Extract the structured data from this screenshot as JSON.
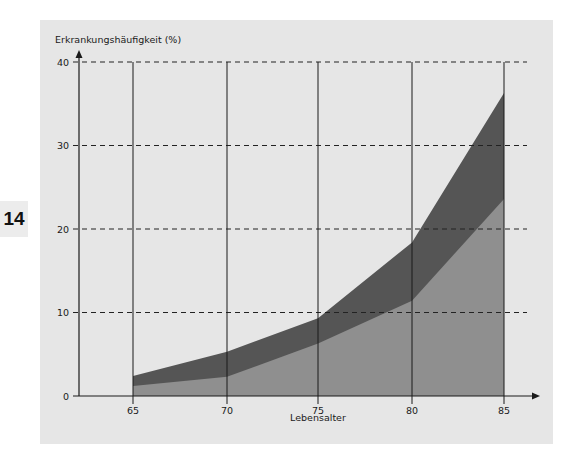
{
  "chapter_badge": "14",
  "chart_data": {
    "type": "area",
    "title": "",
    "ylabel": "Erkrankungshäufigkeit (%)",
    "xlabel": "Lebensalter",
    "x": [
      65,
      70,
      75,
      80,
      85
    ],
    "xticks": [
      "65",
      "70",
      "75",
      "80",
      "85"
    ],
    "yticks": [
      "0",
      "10",
      "20",
      "30",
      "40"
    ],
    "ylim": [
      0,
      40
    ],
    "grid": {
      "horizontal": "dashed",
      "vertical": "solid"
    },
    "legend": null,
    "series": [
      {
        "name": "lower band (light gray)",
        "values": [
          1.2,
          2.3,
          6.3,
          11.4,
          23.6
        ],
        "color": "#8f8f8f"
      },
      {
        "name": "upper bound (dark gray)",
        "values": [
          2.4,
          5.3,
          9.3,
          18.4,
          36.3
        ],
        "color": "#555555"
      }
    ]
  },
  "colors": {
    "panel": "#e6e6e6",
    "light_area": "#8f8f8f",
    "dark_area": "#555555",
    "axis": "#1a1a1a"
  }
}
